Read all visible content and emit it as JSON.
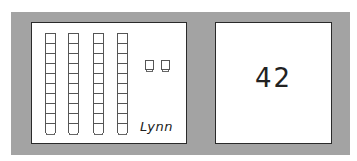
{
  "left_card": {
    "model": "base-ten blocks",
    "tens_rods": 4,
    "units_per_rod": 10,
    "ones_cubes": 2,
    "student_name": "Lynn"
  },
  "right_card": {
    "number": "42"
  },
  "colors": {
    "panel": "#a3a3a3",
    "card": "#ffffff",
    "border": "#2a2a2a"
  }
}
